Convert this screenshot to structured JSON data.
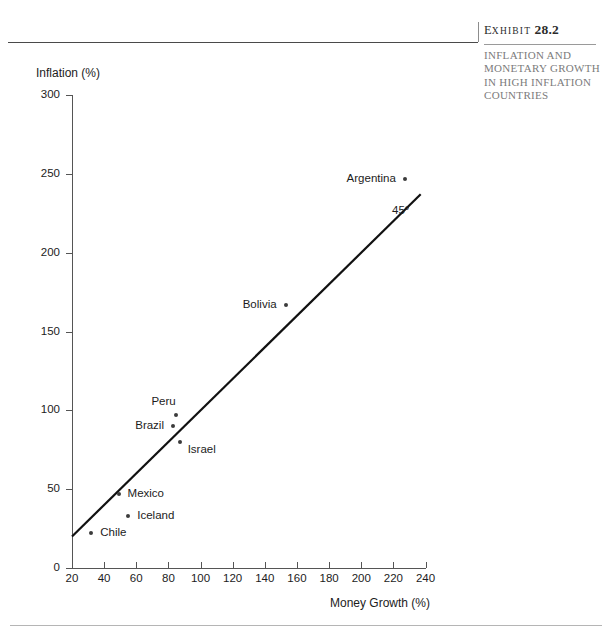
{
  "exhibit": {
    "label_prefix": "E",
    "label_word": "XHIBIT",
    "number": "28.2",
    "caption": "INFLATION AND MONETARY GROWTH IN HIGH INFLATION COUNTRIES"
  },
  "chart_data": {
    "type": "scatter",
    "title": "",
    "xlabel": "Money Growth (%)",
    "ylabel": "Inflation (%)",
    "xlim": [
      20,
      240
    ],
    "ylim": [
      0,
      300
    ],
    "xticks": [
      "20",
      "40",
      "60",
      "80",
      "100",
      "120",
      "140",
      "160",
      "180",
      "200",
      "220",
      "240"
    ],
    "yticks": [
      "0",
      "50",
      "100",
      "150",
      "200",
      "250",
      "300"
    ],
    "grid": false,
    "legend": "none",
    "annotations": [
      {
        "text": "45°",
        "x": 215,
        "y": 215
      }
    ],
    "reference_line": {
      "label": "45°",
      "from": [
        20,
        20
      ],
      "to": [
        237,
        237
      ]
    },
    "points": [
      {
        "name": "Argentina",
        "x": 227,
        "y": 247,
        "label_pos": "left"
      },
      {
        "name": "Bolivia",
        "x": 153,
        "y": 167,
        "label_pos": "left"
      },
      {
        "name": "Peru",
        "x": 85,
        "y": 97,
        "label_pos": "above-left"
      },
      {
        "name": "Brazil",
        "x": 83,
        "y": 90,
        "label_pos": "left"
      },
      {
        "name": "Israel",
        "x": 87,
        "y": 80,
        "label_pos": "right-below"
      },
      {
        "name": "Mexico",
        "x": 49,
        "y": 47,
        "label_pos": "right"
      },
      {
        "name": "Iceland",
        "x": 55,
        "y": 33,
        "label_pos": "right"
      },
      {
        "name": "Chile",
        "x": 32,
        "y": 22,
        "label_pos": "right"
      }
    ]
  }
}
